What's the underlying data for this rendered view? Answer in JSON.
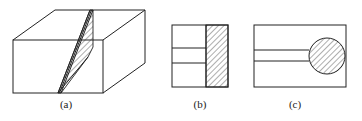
{
  "figures": [
    {
      "id": "a",
      "label": "(a)",
      "description": "3D rectangular block with inclined hatched slab cutting through it"
    },
    {
      "id": "b",
      "label": "(b)",
      "description": "Front view: rectangle with two horizontal lines and hatched right strip"
    },
    {
      "id": "c",
      "label": "(c)",
      "description": "View: rectangle with two horizontal lines ending at a hatched circle"
    }
  ],
  "colors": {
    "stroke": "#222222",
    "background": "#ffffff"
  }
}
